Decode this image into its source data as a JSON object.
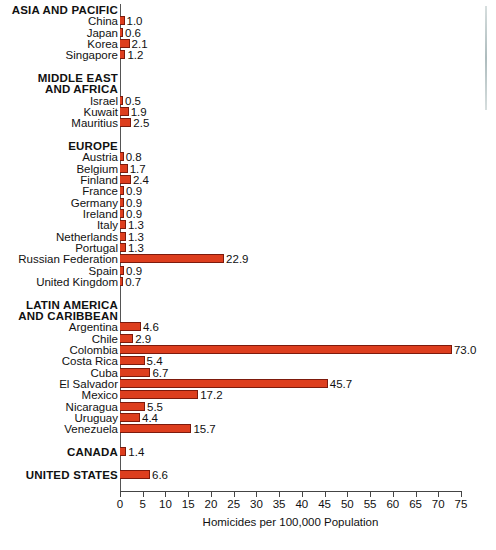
{
  "chart_data": {
    "type": "bar",
    "orientation": "horizontal",
    "title": "",
    "xlabel": "Homicides per 100,000 Population",
    "ylabel": "",
    "xlim": [
      0,
      75
    ],
    "xticks": [
      0,
      5,
      10,
      15,
      20,
      25,
      30,
      35,
      40,
      45,
      50,
      55,
      60,
      65,
      70,
      75
    ],
    "grid": false,
    "legend": null,
    "bar_color": "#dd3e1e",
    "bar_edge_color": "#7d1a0c",
    "rows": [
      {
        "kind": "group",
        "label": "ASIA AND PACIFIC",
        "value": null
      },
      {
        "kind": "bar",
        "label": "China",
        "value": 1.0
      },
      {
        "kind": "bar",
        "label": "Japan",
        "value": 0.6
      },
      {
        "kind": "bar",
        "label": "Korea",
        "value": 2.1
      },
      {
        "kind": "bar",
        "label": "Singapore",
        "value": 1.2
      },
      {
        "kind": "spacer",
        "label": "",
        "value": null
      },
      {
        "kind": "group",
        "label": "MIDDLE EAST",
        "value": null
      },
      {
        "kind": "group",
        "label": "AND AFRICA",
        "value": null
      },
      {
        "kind": "bar",
        "label": "Israel",
        "value": 0.5
      },
      {
        "kind": "bar",
        "label": "Kuwait",
        "value": 1.9
      },
      {
        "kind": "bar",
        "label": "Mauritius",
        "value": 2.5
      },
      {
        "kind": "spacer",
        "label": "",
        "value": null
      },
      {
        "kind": "group",
        "label": "EUROPE",
        "value": null
      },
      {
        "kind": "bar",
        "label": "Austria",
        "value": 0.8
      },
      {
        "kind": "bar",
        "label": "Belgium",
        "value": 1.7
      },
      {
        "kind": "bar",
        "label": "Finland",
        "value": 2.4
      },
      {
        "kind": "bar",
        "label": "France",
        "value": 0.9
      },
      {
        "kind": "bar",
        "label": "Germany",
        "value": 0.9
      },
      {
        "kind": "bar",
        "label": "Ireland",
        "value": 0.9
      },
      {
        "kind": "bar",
        "label": "Italy",
        "value": 1.3
      },
      {
        "kind": "bar",
        "label": "Netherlands",
        "value": 1.3
      },
      {
        "kind": "bar",
        "label": "Portugal",
        "value": 1.3
      },
      {
        "kind": "bar",
        "label": "Russian Federation",
        "value": 22.9
      },
      {
        "kind": "bar",
        "label": "Spain",
        "value": 0.9
      },
      {
        "kind": "bar",
        "label": "United Kingdom",
        "value": 0.7
      },
      {
        "kind": "spacer",
        "label": "",
        "value": null
      },
      {
        "kind": "group",
        "label": "LATIN AMERICA",
        "value": null
      },
      {
        "kind": "group",
        "label": "AND CARIBBEAN",
        "value": null
      },
      {
        "kind": "bar",
        "label": "Argentina",
        "value": 4.6
      },
      {
        "kind": "bar",
        "label": "Chile",
        "value": 2.9
      },
      {
        "kind": "bar",
        "label": "Colombia",
        "value": 73.0
      },
      {
        "kind": "bar",
        "label": "Costa Rica",
        "value": 5.4
      },
      {
        "kind": "bar",
        "label": "Cuba",
        "value": 6.7
      },
      {
        "kind": "bar",
        "label": "El Salvador",
        "value": 45.7
      },
      {
        "kind": "bar",
        "label": "Mexico",
        "value": 17.2
      },
      {
        "kind": "bar",
        "label": "Nicaragua",
        "value": 5.5
      },
      {
        "kind": "bar",
        "label": "Uruguay",
        "value": 4.4
      },
      {
        "kind": "bar",
        "label": "Venezuela",
        "value": 15.7
      },
      {
        "kind": "spacer",
        "label": "",
        "value": null
      },
      {
        "kind": "bar-bold",
        "label": "CANADA",
        "value": 1.4
      },
      {
        "kind": "spacer",
        "label": "",
        "value": null
      },
      {
        "kind": "bar-bold",
        "label": "UNITED STATES",
        "value": 6.6
      }
    ]
  }
}
